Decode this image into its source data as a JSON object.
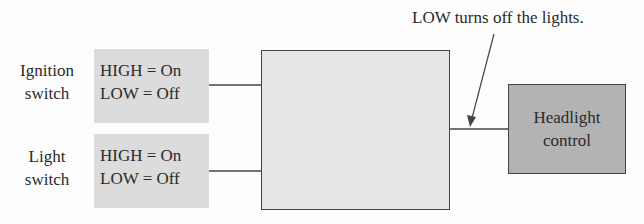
{
  "inputs": [
    {
      "label_line1": "Ignition",
      "label_line2": "switch",
      "high": "HIGH = On",
      "low": "LOW = Off"
    },
    {
      "label_line1": "Light",
      "label_line2": "switch",
      "high": "HIGH = On",
      "low": "LOW = Off"
    }
  ],
  "output": {
    "line1": "Headlight",
    "line2": "control"
  },
  "annotation": "LOW turns off the lights.",
  "colors": {
    "signal_box": "#dcdcdc",
    "logic_box": "#e6e6e6",
    "output_box": "#b3b3b3",
    "line": "#444444"
  }
}
